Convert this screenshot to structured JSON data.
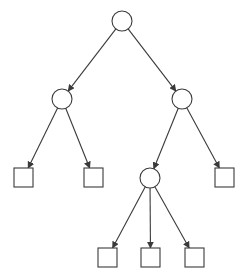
{
  "diagram": {
    "type": "tree",
    "title": "",
    "colors": {
      "stroke": "#3a3a3a",
      "fill": "#ffffff",
      "background": "#ffffff"
    },
    "nodes": [
      {
        "id": "n0",
        "shape": "circle",
        "label": "",
        "cx": 122,
        "cy": 21,
        "r": 10
      },
      {
        "id": "n1",
        "shape": "circle",
        "label": "",
        "cx": 62,
        "cy": 99,
        "r": 10
      },
      {
        "id": "n2",
        "shape": "circle",
        "label": "",
        "cx": 182,
        "cy": 99,
        "r": 10
      },
      {
        "id": "n3",
        "shape": "square",
        "label": "",
        "x": 14,
        "y": 168,
        "size": 19
      },
      {
        "id": "n4",
        "shape": "square",
        "label": "",
        "x": 84,
        "y": 168,
        "size": 19
      },
      {
        "id": "n5",
        "shape": "circle",
        "label": "",
        "cx": 150,
        "cy": 178,
        "r": 10
      },
      {
        "id": "n6",
        "shape": "square",
        "label": "",
        "x": 215,
        "y": 168,
        "size": 19
      },
      {
        "id": "n7",
        "shape": "square",
        "label": "",
        "x": 98,
        "y": 248,
        "size": 19
      },
      {
        "id": "n8",
        "shape": "square",
        "label": "",
        "x": 141,
        "y": 248,
        "size": 19
      },
      {
        "id": "n9",
        "shape": "square",
        "label": "",
        "x": 185,
        "y": 248,
        "size": 19
      }
    ],
    "edges": [
      {
        "from": "n0",
        "to": "n1",
        "directed": true
      },
      {
        "from": "n0",
        "to": "n2",
        "directed": true
      },
      {
        "from": "n1",
        "to": "n3",
        "directed": true
      },
      {
        "from": "n1",
        "to": "n4",
        "directed": true
      },
      {
        "from": "n2",
        "to": "n5",
        "directed": true
      },
      {
        "from": "n2",
        "to": "n6",
        "directed": true
      },
      {
        "from": "n5",
        "to": "n7",
        "directed": true
      },
      {
        "from": "n5",
        "to": "n8",
        "directed": true
      },
      {
        "from": "n5",
        "to": "n9",
        "directed": true
      }
    ]
  }
}
